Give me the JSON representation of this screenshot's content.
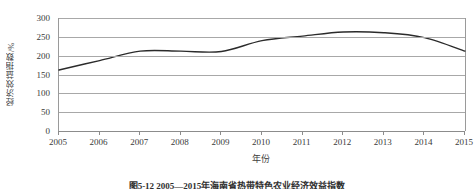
{
  "chart_data": {
    "type": "line",
    "title": "",
    "xlabel": "年份",
    "ylabel": "经济效益指数/%",
    "x": [
      2005,
      2006,
      2007,
      2008,
      2009,
      2010,
      2011,
      2012,
      2013,
      2014,
      2015
    ],
    "categories": [
      "2005",
      "2006",
      "2007",
      "2008",
      "2009",
      "2010",
      "2011",
      "2012",
      "2013",
      "2014",
      "2015"
    ],
    "values": [
      162,
      187,
      212,
      212,
      211,
      240,
      252,
      263,
      261,
      248,
      212
    ],
    "series": [
      {
        "name": "经济效益指数",
        "values": [
          162,
          187,
          212,
          212,
          211,
          240,
          252,
          263,
          261,
          248,
          212
        ]
      }
    ],
    "ylim": [
      0,
      300
    ],
    "yticks": [
      0,
      50,
      100,
      150,
      200,
      250,
      300
    ],
    "ytick_labels": [
      "0",
      "50",
      "100",
      "150",
      "200",
      "250",
      "300"
    ],
    "xlim": [
      2005,
      2015
    ],
    "grid": "horizontal",
    "legend": "none",
    "smoothed": true,
    "line_color": "#2b2b2b",
    "grid_color": "#a8a8a8",
    "axis_color": "#8c8c8c"
  },
  "caption": {
    "text": "图5-12  2005—2015年海南省热带特色农业经济效益指数"
  }
}
